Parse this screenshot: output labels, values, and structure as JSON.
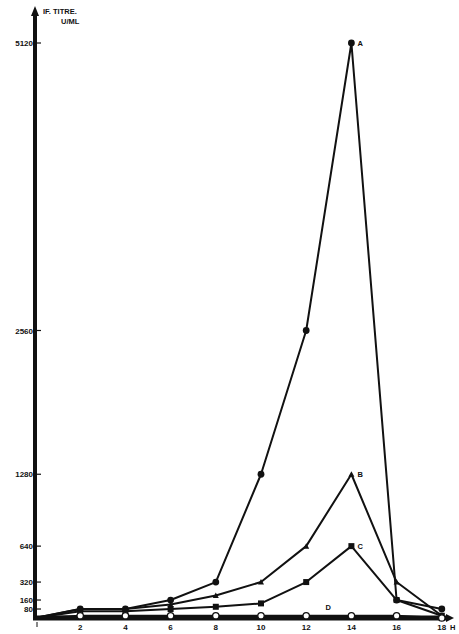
{
  "chart_data": {
    "type": "line",
    "title": "",
    "ylabel": "IF. TITRE. U/ML",
    "ylabel_lines": [
      "IF. TITRE.",
      "U/ML"
    ],
    "xlabel": "H",
    "x": [
      0,
      2,
      4,
      6,
      8,
      10,
      12,
      14,
      16,
      18
    ],
    "xticks": [
      2,
      4,
      6,
      8,
      10,
      12,
      14,
      16,
      18
    ],
    "yticks": [
      80,
      160,
      320,
      640,
      1280,
      2560,
      5120
    ],
    "xlim": [
      0,
      18
    ],
    "ylim": [
      0,
      5120
    ],
    "grid": false,
    "legend": "inline labels at series peaks",
    "series": [
      {
        "name": "A",
        "marker": "filled-circle",
        "values": [
          0,
          80,
          80,
          160,
          320,
          1280,
          2560,
          5120,
          160,
          80
        ]
      },
      {
        "name": "B",
        "marker": "filled-triangle",
        "values": [
          0,
          80,
          80,
          120,
          200,
          320,
          640,
          1280,
          320,
          20
        ]
      },
      {
        "name": "C",
        "marker": "filled-square",
        "values": [
          0,
          60,
          60,
          80,
          100,
          130,
          320,
          640,
          160,
          20
        ]
      },
      {
        "name": "D",
        "marker": "open-circle",
        "values": [
          0,
          20,
          20,
          20,
          20,
          20,
          20,
          20,
          20,
          0
        ]
      }
    ]
  },
  "layout": {
    "origin_px": [
      35,
      618
    ],
    "x_px_per_unit": 22.6,
    "y_top_px": 43,
    "ink": "#111111",
    "background": "#ffffff"
  }
}
